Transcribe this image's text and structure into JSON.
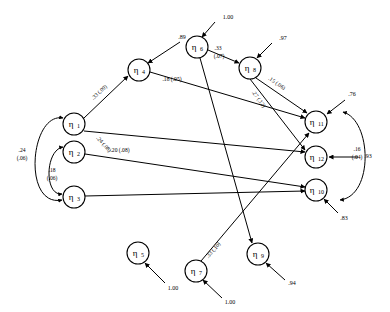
{
  "diagram": {
    "kind": "path-diagram",
    "title": "",
    "background_color": "#ffffff",
    "stroke_color": "#000000",
    "nodes": [
      {
        "id": "eta1",
        "label": "η",
        "sub": "1",
        "x": 74,
        "y": 124,
        "r": 11
      },
      {
        "id": "eta2",
        "label": "η",
        "sub": "2",
        "x": 74,
        "y": 152,
        "r": 11
      },
      {
        "id": "eta3",
        "label": "η",
        "sub": "3",
        "x": 74,
        "y": 197,
        "r": 11
      },
      {
        "id": "eta4",
        "label": "η",
        "sub": "4",
        "x": 139,
        "y": 70,
        "r": 11
      },
      {
        "id": "eta5",
        "label": "η",
        "sub": "5",
        "x": 138,
        "y": 253,
        "r": 11
      },
      {
        "id": "eta6",
        "label": "η",
        "sub": "6",
        "x": 197,
        "y": 47,
        "r": 11
      },
      {
        "id": "eta7",
        "label": "η",
        "sub": "7",
        "x": 196,
        "y": 271,
        "r": 11
      },
      {
        "id": "eta8",
        "label": "η",
        "sub": "8",
        "x": 250,
        "y": 68,
        "r": 11
      },
      {
        "id": "eta9",
        "label": "η",
        "sub": "9",
        "x": 258,
        "y": 254,
        "r": 11
      },
      {
        "id": "eta10",
        "label": "η",
        "sub": "10",
        "x": 316,
        "y": 190,
        "r": 11
      },
      {
        "id": "eta11",
        "label": "η",
        "sub": "11",
        "x": 316,
        "y": 122,
        "r": 11
      },
      {
        "id": "eta12",
        "label": "η",
        "sub": "12",
        "x": 316,
        "y": 157,
        "r": 11
      }
    ],
    "paths": [
      {
        "id": "p-eta1-eta4",
        "from": "eta1",
        "to": "eta4",
        "coefficient": ".33",
        "standard_error": "(.09)",
        "label": ".33 (.09)"
      },
      {
        "id": "p-eta1-eta12",
        "from": "eta1",
        "to": "eta12",
        "coefficient": ".24",
        "standard_error": "(.08)",
        "label": ".24 (.08)"
      },
      {
        "id": "p-eta2-eta10",
        "from": "eta2",
        "to": "eta10",
        "coefficient": ".20",
        "standard_error": "(.08)",
        "label": ".20 (.08)"
      },
      {
        "id": "p-eta3-eta10",
        "from": "eta3",
        "to": "eta10",
        "coefficient": "",
        "standard_error": "",
        "label": ""
      },
      {
        "id": "p-eta4-eta11",
        "from": "eta4",
        "to": "eta11",
        "coefficient": ".18",
        "standard_error": "(.05)",
        "label": ".18 (.05)"
      },
      {
        "id": "p-eta6-eta9",
        "from": "eta6",
        "to": "eta9",
        "coefficient": ".33",
        "standard_error": "(.07)",
        "label": ".33 (.07)"
      },
      {
        "id": "p-eta6-eta8",
        "from": "eta6",
        "to": "eta8",
        "coefficient": "",
        "standard_error": "",
        "label": ""
      },
      {
        "id": "p-eta8-eta11",
        "from": "eta8",
        "to": "eta11",
        "coefficient": ".15",
        "standard_error": "(.06)",
        "label": ".15 (.06)"
      },
      {
        "id": "p-eta8-eta12",
        "from": "eta8",
        "to": "eta12",
        "coefficient": ".27",
        "standard_error": "(.12)",
        "label": ".27 (.12)"
      },
      {
        "id": "p-eta7-eta11",
        "from": "eta7",
        "to": "eta11",
        "coefficient": ".33",
        "standard_error": "(.10)",
        "label": ".33 (.10)"
      }
    ],
    "correlations": [
      {
        "id": "c-eta1-eta3",
        "between": [
          "eta1",
          "eta3"
        ],
        "coefficient": ".24",
        "standard_error": "(.06)",
        "label_line1": ".24",
        "label_line2": "(.06)"
      },
      {
        "id": "c-eta2-eta3",
        "between": [
          "eta2",
          "eta3"
        ],
        "coefficient": ".18",
        "standard_error": "(.06)",
        "label_line1": ".18",
        "label_line2": "(.06)"
      },
      {
        "id": "c-eta11-eta10",
        "between": [
          "eta11",
          "eta10"
        ],
        "coefficient": ".16",
        "standard_error": "(.04)",
        "label_line1": ".16",
        "label_line2": "(.04)"
      }
    ],
    "disturbances": [
      {
        "id": "d-eta6",
        "target": "eta6",
        "value": "1.00"
      },
      {
        "id": "d-eta8",
        "target": "eta8",
        "value": ".97"
      },
      {
        "id": "d-eta4",
        "target": "eta4",
        "value": ".89"
      },
      {
        "id": "d-eta11",
        "target": "eta11",
        "value": ".76"
      },
      {
        "id": "d-eta12",
        "target": "eta12",
        "value": ".93"
      },
      {
        "id": "d-eta10",
        "target": "eta10",
        "value": ".83"
      },
      {
        "id": "d-eta9",
        "target": "eta9",
        "value": ".94"
      },
      {
        "id": "d-eta5",
        "target": "eta5",
        "value": "1.00"
      },
      {
        "id": "d-eta7",
        "target": "eta7",
        "value": "1.00"
      }
    ]
  }
}
